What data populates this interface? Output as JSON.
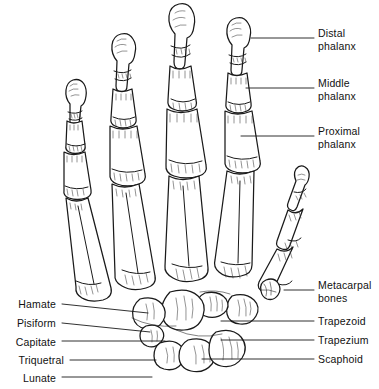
{
  "figure": {
    "background_color": "#ffffff",
    "line_color": "#1a1a1a",
    "width": 379,
    "height": 389
  },
  "labels": {
    "right": [
      {
        "id": "distal-phalanx",
        "line1": "Distal",
        "line2": "phalanx",
        "text_x": 318,
        "text_y": 27,
        "leader": {
          "x1": 251,
          "y1": 38,
          "x2": 314,
          "y2": 38
        }
      },
      {
        "id": "middle-phalanx",
        "line1": "Middle",
        "line2": "phalanx",
        "text_x": 318,
        "text_y": 77,
        "leader": {
          "x1": 246,
          "y1": 88,
          "x2": 314,
          "y2": 88
        }
      },
      {
        "id": "proximal-phalanx",
        "line1": "Proximal",
        "line2": "phalanx",
        "text_x": 318,
        "text_y": 125,
        "leader": {
          "x1": 241,
          "y1": 136,
          "x2": 314,
          "y2": 136
        }
      },
      {
        "id": "metacarpal-bones",
        "line1": "Metacarpal",
        "line2": "bones",
        "text_x": 318,
        "text_y": 279,
        "leader": {
          "x1": 284,
          "y1": 290,
          "x2": 314,
          "y2": 290
        }
      },
      {
        "id": "trapezoid",
        "line1": "Trapezoid",
        "line2": "",
        "text_x": 318,
        "text_y": 315,
        "leader": {
          "x1": 221,
          "y1": 321,
          "x2": 314,
          "y2": 321
        }
      },
      {
        "id": "trapezium",
        "line1": "Trapezium",
        "line2": "",
        "text_x": 318,
        "text_y": 334,
        "leader": {
          "x1": 221,
          "y1": 340,
          "x2": 314,
          "y2": 340
        }
      },
      {
        "id": "scaphoid",
        "line1": "Scaphoid",
        "line2": "",
        "text_x": 318,
        "text_y": 353,
        "leader": {
          "x1": 202,
          "y1": 359,
          "x2": 314,
          "y2": 359
        }
      }
    ],
    "left": [
      {
        "id": "hamate",
        "line1": "Hamate",
        "line2": "",
        "text_right_x": 56,
        "text_y": 298,
        "leader": {
          "x1": 62,
          "y1": 304,
          "x2": 148,
          "y2": 313
        }
      },
      {
        "id": "pisiform",
        "line1": "Pisiform",
        "line2": "",
        "text_right_x": 56,
        "text_y": 317,
        "leader": {
          "x1": 62,
          "y1": 323,
          "x2": 150,
          "y2": 332
        }
      },
      {
        "id": "capitate",
        "line1": "Capitate",
        "line2": "",
        "text_right_x": 56,
        "text_y": 336,
        "leader": {
          "x1": 62,
          "y1": 341,
          "x2": 165,
          "y2": 341
        }
      },
      {
        "id": "triquetral",
        "line1": "Triquetral",
        "line2": "",
        "text_right_x": 64,
        "text_y": 354,
        "leader": {
          "x1": 70,
          "y1": 360,
          "x2": 156,
          "y2": 360
        }
      },
      {
        "id": "lunate",
        "line1": "Lunate",
        "line2": "",
        "text_right_x": 56,
        "text_y": 372,
        "leader": {
          "x1": 62,
          "y1": 377,
          "x2": 152,
          "y2": 377
        }
      }
    ]
  },
  "bone_groups": {
    "phalanges": "distal, middle and proximal phalanges of digits",
    "metacarpals": "five metacarpal bones",
    "carpals": "hamate, pisiform, capitate, triquetral, lunate, trapezoid, trapezium, scaphoid"
  }
}
